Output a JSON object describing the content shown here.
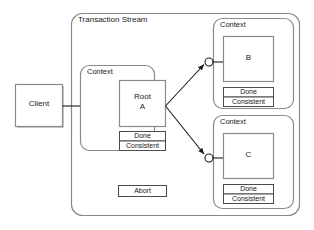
{
  "diagram": {
    "title": "Transaction Stream",
    "outer_container_label": "Transaction Stream",
    "client": {
      "label": "Client"
    },
    "abort": {
      "label": "Abort"
    },
    "status_labels": {
      "done": "Done",
      "consistent": "Consistent"
    },
    "contexts": [
      {
        "id": "context-root",
        "label": "Context",
        "node_line1": "Root",
        "node_line2": "A",
        "done": "Done",
        "consistent": "Consistent"
      },
      {
        "id": "context-b",
        "label": "Context",
        "node_line1": "B",
        "node_line2": "",
        "done": "Done",
        "consistent": "Consistent"
      },
      {
        "id": "context-c",
        "label": "Context",
        "node_line1": "C",
        "node_line2": "",
        "done": "Done",
        "consistent": "Consistent"
      }
    ],
    "colors": {
      "stroke": "#888888",
      "line": "#1a1a1a",
      "fill": "#ffffff",
      "text": "#1a1a1a",
      "shadow": "#c8c8c8"
    }
  }
}
